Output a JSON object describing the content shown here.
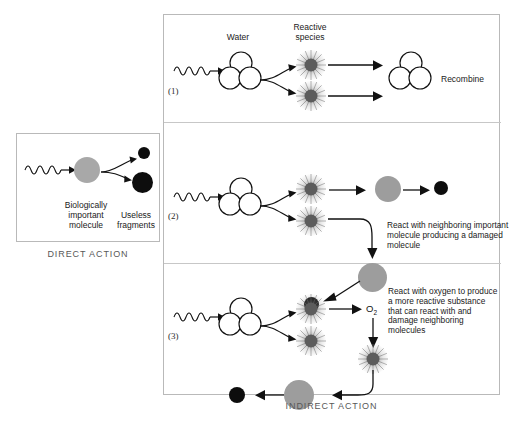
{
  "figure": {
    "direct": {
      "caption": "DIRECT ACTION",
      "molecule_label": "Biologically\nimportant\nmolecule",
      "molecule_label_line1": "Biologically",
      "molecule_label_line2": "important",
      "molecule_label_line3": "molecule",
      "fragments_label_line1": "Useless",
      "fragments_label_line2": "fragments"
    },
    "indirect": {
      "caption": "INDIRECT ACTION",
      "headers": {
        "water": "Water",
        "reactive_line1": "Reactive",
        "reactive_line2": "species"
      },
      "pathways": [
        {
          "number": "(1)",
          "outcome": "Recombine"
        },
        {
          "number": "(2)",
          "outcome": "React with neighboring important molecule producing a damaged molecule"
        },
        {
          "number": "(3)",
          "oxygen": "O",
          "oxygen_sub": "2",
          "outcome": "React with oxygen to produce a more reactive substance that can react with and damage neighboring molecules"
        }
      ]
    }
  },
  "colors": {
    "ink": "#111111",
    "panel_border": "#b9b9b9",
    "caption_text": "#585858",
    "molecule_gray": "#a8a8a8",
    "radical_core": "#5c5c5c",
    "fragment_black": "#0d0d0d"
  }
}
